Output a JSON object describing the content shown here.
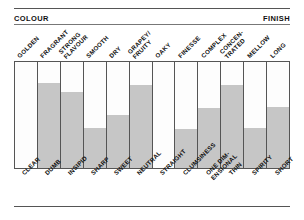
{
  "header": {
    "left_label": "COLOUR",
    "right_label": "FINISH"
  },
  "chart_data": {
    "type": "bar",
    "title": "",
    "subtitle": "",
    "xlabel": "",
    "ylabel": "",
    "ylim": [
      0,
      100
    ],
    "grid": false,
    "legend_position": "none",
    "axis_start_label": "COLOUR",
    "axis_end_label": "FINISH",
    "categories": [
      "GOLDEN",
      "FRAGRANT",
      "STRONG FLAVOUR",
      "SMOOTH",
      "DRY",
      "GRAPEY/ FRUITY",
      "OAKY",
      "FINESSE",
      "COMPLEX",
      "CONCEN- TRATED",
      "MELLOW",
      "LONG"
    ],
    "categories_bottom": [
      "CLEAR",
      "DUMB",
      "INSIPID",
      "SHARP",
      "SWEET",
      "NEUTRAL",
      "STRAIGHT",
      "CLUMSINESS",
      "ONE DIM- ENSIONAL",
      "THIN",
      "SPIRITY",
      "SHORT"
    ],
    "values": [
      0,
      80,
      72,
      38,
      50,
      78,
      0,
      37,
      57,
      78,
      38,
      58
    ],
    "bar_color": "#c6c6c6",
    "frame_color": "#555555"
  },
  "top_labels": [
    {
      "line1": "GOLDEN",
      "line2": ""
    },
    {
      "line1": "FRAGRANT",
      "line2": ""
    },
    {
      "line1": "STRONG",
      "line2": "FLAVOUR"
    },
    {
      "line1": "SMOOTH",
      "line2": ""
    },
    {
      "line1": "DRY",
      "line2": ""
    },
    {
      "line1": "GRAPEY/",
      "line2": "FRUITY"
    },
    {
      "line1": "OAKY",
      "line2": ""
    },
    {
      "line1": "FINESSE",
      "line2": ""
    },
    {
      "line1": "COMPLEX",
      "line2": ""
    },
    {
      "line1": "CONCEN-",
      "line2": "TRATED"
    },
    {
      "line1": "MELLOW",
      "line2": ""
    },
    {
      "line1": "LONG",
      "line2": ""
    }
  ],
  "bottom_labels": [
    {
      "line1": "CLEAR",
      "line2": ""
    },
    {
      "line1": "DUMB",
      "line2": ""
    },
    {
      "line1": "INSIPID",
      "line2": ""
    },
    {
      "line1": "SHARP",
      "line2": ""
    },
    {
      "line1": "SWEET",
      "line2": ""
    },
    {
      "line1": "NEUTRAL",
      "line2": ""
    },
    {
      "line1": "STRAIGHT",
      "line2": ""
    },
    {
      "line1": "CLUMSINESS",
      "line2": ""
    },
    {
      "line1": "ONE DIM-",
      "line2": "ENSIONAL"
    },
    {
      "line1": "THIN",
      "line2": ""
    },
    {
      "line1": "SPIRITY",
      "line2": ""
    },
    {
      "line1": "SHORT",
      "line2": ""
    }
  ]
}
